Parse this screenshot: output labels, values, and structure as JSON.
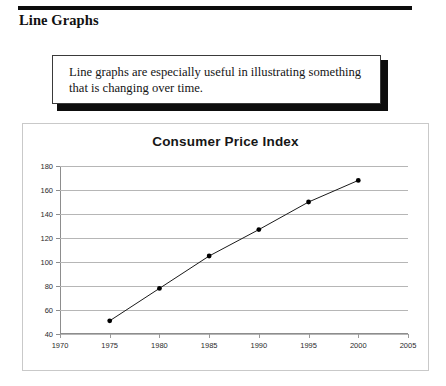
{
  "header": {
    "title": "Line Graphs"
  },
  "callout": {
    "text": "Line graphs are especially useful in illustrating something that is changing over time."
  },
  "chart_data": {
    "type": "line",
    "title": "Consumer Price Index",
    "xlabel": "",
    "ylabel": "",
    "x": [
      1975,
      1980,
      1985,
      1990,
      1995,
      2000
    ],
    "values": [
      51,
      78,
      105,
      127,
      150,
      168
    ],
    "series": [
      {
        "name": "Consumer Price Index",
        "values": [
          51,
          78,
          105,
          127,
          150,
          168
        ]
      }
    ],
    "xlim": [
      1970,
      2005
    ],
    "ylim": [
      40,
      180
    ],
    "xticks": [
      1970,
      1975,
      1980,
      1985,
      1990,
      1995,
      2000,
      2005
    ],
    "yticks": [
      40,
      60,
      80,
      100,
      120,
      140,
      160,
      180
    ],
    "xtick_labels": [
      "1970",
      "1975",
      "1980",
      "1985",
      "1990",
      "1995",
      "2000",
      "2005"
    ],
    "ytick_labels": [
      "40",
      "60",
      "80",
      "100",
      "120",
      "140",
      "160",
      "180"
    ],
    "grid": "horizontal",
    "legend": "none",
    "line_color": "#1a1a1a",
    "marker": "circle",
    "marker_color": "#000000",
    "grid_color": "#b6b6b6"
  }
}
